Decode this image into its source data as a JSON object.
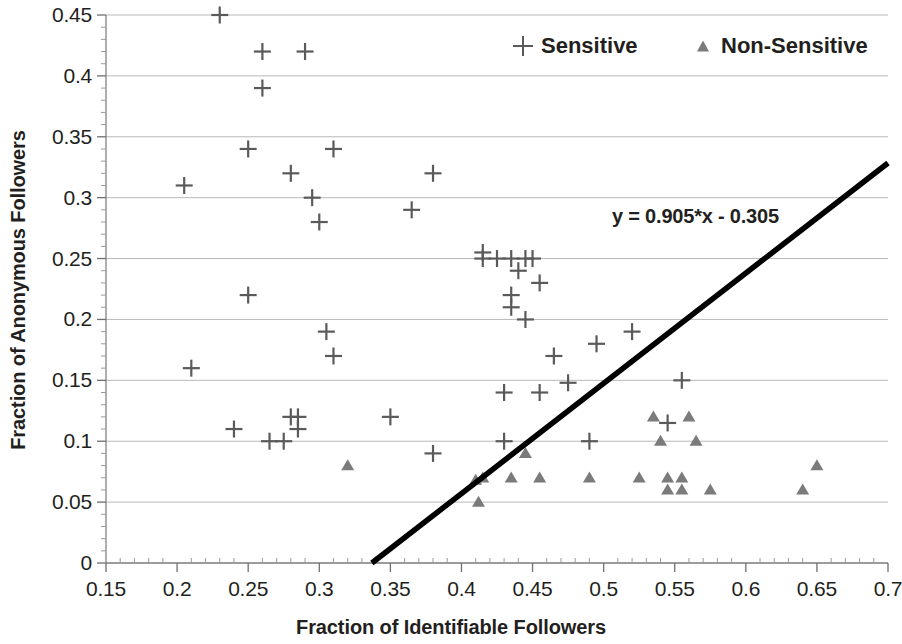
{
  "chart_data": {
    "type": "scatter",
    "title": "",
    "xlabel": "Fraction of Identifiable Followers",
    "ylabel": "Fraction of Anonymous Followers",
    "xlim": [
      0.15,
      0.7
    ],
    "ylim": [
      0,
      0.45
    ],
    "xticks": [
      "0.15",
      "0.2",
      "0.25",
      "0.3",
      "0.35",
      "0.4",
      "0.45",
      "0.5",
      "0.55",
      "0.6",
      "0.65",
      "0.7"
    ],
    "xtick_values": [
      0.15,
      0.2,
      0.25,
      0.3,
      0.35,
      0.4,
      0.45,
      0.5,
      0.55,
      0.6,
      0.65,
      0.7
    ],
    "yticks": [
      "0",
      "0.05",
      "0.1",
      "0.15",
      "0.2",
      "0.25",
      "0.3",
      "0.35",
      "0.4",
      "0.45"
    ],
    "ytick_values": [
      0,
      0.05,
      0.1,
      0.15,
      0.2,
      0.25,
      0.3,
      0.35,
      0.4,
      0.45
    ],
    "grid": "horizontal",
    "legend_position": "top-right",
    "marker_color_sensitive": "#5a5a5a",
    "marker_color_nonsensitive": "#7b7b7b",
    "trendline_color": "#000000",
    "series": [
      {
        "name": "Sensitive",
        "marker": "plus",
        "color": "#5a5a5a",
        "points": [
          [
            0.23,
            0.45
          ],
          [
            0.26,
            0.42
          ],
          [
            0.29,
            0.42
          ],
          [
            0.26,
            0.39
          ],
          [
            0.31,
            0.34
          ],
          [
            0.25,
            0.34
          ],
          [
            0.38,
            0.32
          ],
          [
            0.28,
            0.32
          ],
          [
            0.205,
            0.31
          ],
          [
            0.295,
            0.3
          ],
          [
            0.365,
            0.29
          ],
          [
            0.3,
            0.28
          ],
          [
            0.415,
            0.255
          ],
          [
            0.415,
            0.25
          ],
          [
            0.425,
            0.25
          ],
          [
            0.435,
            0.25
          ],
          [
            0.445,
            0.25
          ],
          [
            0.45,
            0.25
          ],
          [
            0.44,
            0.24
          ],
          [
            0.455,
            0.23
          ],
          [
            0.25,
            0.22
          ],
          [
            0.435,
            0.22
          ],
          [
            0.435,
            0.21
          ],
          [
            0.445,
            0.2
          ],
          [
            0.305,
            0.19
          ],
          [
            0.52,
            0.19
          ],
          [
            0.495,
            0.18
          ],
          [
            0.31,
            0.17
          ],
          [
            0.465,
            0.17
          ],
          [
            0.21,
            0.16
          ],
          [
            0.555,
            0.15
          ],
          [
            0.475,
            0.148
          ],
          [
            0.455,
            0.14
          ],
          [
            0.43,
            0.14
          ],
          [
            0.28,
            0.12
          ],
          [
            0.285,
            0.12
          ],
          [
            0.35,
            0.12
          ],
          [
            0.285,
            0.11
          ],
          [
            0.24,
            0.11
          ],
          [
            0.545,
            0.115
          ],
          [
            0.265,
            0.1
          ],
          [
            0.275,
            0.1
          ],
          [
            0.43,
            0.1
          ],
          [
            0.49,
            0.1
          ],
          [
            0.38,
            0.09
          ]
        ]
      },
      {
        "name": "Non-Sensitive",
        "marker": "triangle",
        "color": "#7b7b7b",
        "points": [
          [
            0.535,
            0.12
          ],
          [
            0.56,
            0.12
          ],
          [
            0.54,
            0.1
          ],
          [
            0.565,
            0.1
          ],
          [
            0.32,
            0.08
          ],
          [
            0.65,
            0.08
          ],
          [
            0.445,
            0.09
          ],
          [
            0.415,
            0.07
          ],
          [
            0.435,
            0.07
          ],
          [
            0.455,
            0.07
          ],
          [
            0.49,
            0.07
          ],
          [
            0.525,
            0.07
          ],
          [
            0.545,
            0.07
          ],
          [
            0.555,
            0.07
          ],
          [
            0.41,
            0.068
          ],
          [
            0.545,
            0.06
          ],
          [
            0.555,
            0.06
          ],
          [
            0.575,
            0.06
          ],
          [
            0.64,
            0.06
          ],
          [
            0.412,
            0.05
          ]
        ]
      }
    ],
    "trendline": {
      "equation": "y = 0.905*x - 0.305",
      "slope": 0.905,
      "intercept": -0.305,
      "x_start": 0.337,
      "x_end": 0.7
    }
  }
}
